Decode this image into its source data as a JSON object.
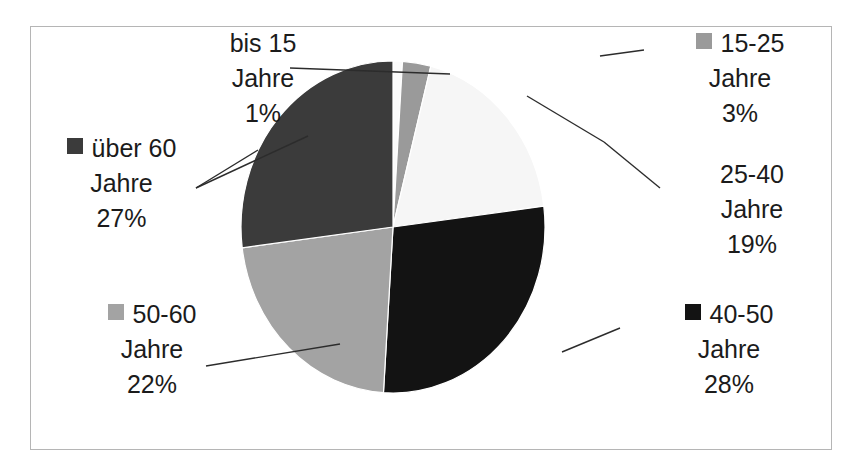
{
  "chart_data": {
    "type": "pie",
    "title": "",
    "categories": [
      "bis 15 Jahre",
      "15-25 Jahre",
      "25-40 Jahre",
      "40-50 Jahre",
      "50-60 Jahre",
      "über 60 Jahre"
    ],
    "values": [
      1,
      3,
      19,
      28,
      22,
      27
    ],
    "value_unit": "%",
    "slice_colors": [
      "#fbfbfb",
      "#9a9a9a",
      "#f6f6f6",
      "#131313",
      "#a3a3a3",
      "#3b3b3b"
    ],
    "start_angle_deg": 0,
    "direction": "clockwise",
    "legend": "inline-callouts",
    "grid": false,
    "labels_show_percent": true
  },
  "frame": {
    "border_color": "#b5b5b5",
    "background": "#ffffff"
  },
  "callouts": [
    {
      "id": "bis15",
      "category": "bis 15",
      "line1": "bis 15",
      "line2": "Jahre",
      "line3": "1%",
      "swatch_color": "#fbfbfb",
      "swatch_visible": false,
      "align": "center"
    },
    {
      "id": "15-25",
      "category": "15-25",
      "line1": "15-25",
      "line2": "Jahre",
      "line3": "3%",
      "swatch_color": "#9a9a9a",
      "swatch_visible": true,
      "align": "center"
    },
    {
      "id": "25-40",
      "category": "25-40",
      "line1": "25-40",
      "line2": "Jahre",
      "line3": "19%",
      "swatch_color": "#f6f6f6",
      "swatch_visible": false,
      "align": "center"
    },
    {
      "id": "40-50",
      "category": "40-50",
      "line1": "40-50",
      "line2": "Jahre",
      "line3": "28%",
      "swatch_color": "#131313",
      "swatch_visible": true,
      "align": "center"
    },
    {
      "id": "50-60",
      "category": "50-60",
      "line1": "50-60",
      "line2": "Jahre",
      "line3": "22%",
      "swatch_color": "#a3a3a3",
      "swatch_visible": true,
      "align": "center"
    },
    {
      "id": "ueber60",
      "category": "über 60",
      "line1": "über 60",
      "line2": "Jahre",
      "line3": "27%",
      "swatch_color": "#3b3b3b",
      "swatch_visible": true,
      "align": "center"
    }
  ]
}
